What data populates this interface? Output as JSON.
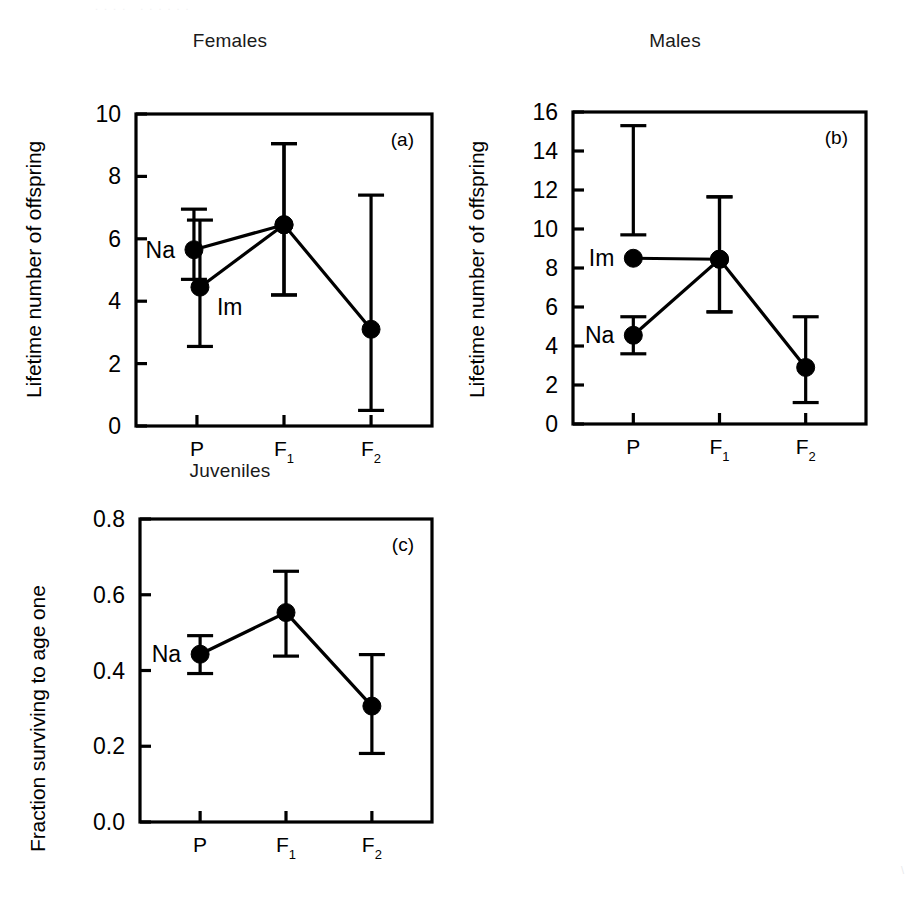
{
  "figure": {
    "background": "#ffffff",
    "ink_color": "#000000",
    "width": 922,
    "height": 898,
    "top_edge_artifact": "....  ......",
    "corner_artifact": "\\"
  },
  "chart_data": [
    {
      "id": "panel-a",
      "type": "line",
      "title": "Females",
      "panel_label": "(a)",
      "xlabel": "",
      "ylabel": "Lifetime number of offspring",
      "x": [
        "P",
        "F1",
        "F2"
      ],
      "x_tick_labels": [
        {
          "base": "P",
          "sub": ""
        },
        {
          "base": "F",
          "sub": "1"
        },
        {
          "base": "F",
          "sub": "2"
        }
      ],
      "ylim": [
        0,
        10
      ],
      "yticks": [
        0,
        2,
        4,
        6,
        8,
        10
      ],
      "ytick_labels": [
        "0",
        "2",
        "4",
        "6",
        "8",
        "10"
      ],
      "grid": false,
      "legend": "inline-labels",
      "error_type": "error bars",
      "series": [
        {
          "name": "Na",
          "label": "Na",
          "label_x": "P",
          "label_anchor": "left",
          "x": [
            "P",
            "F1",
            "F2"
          ],
          "values": [
            5.65,
            6.45,
            3.1
          ],
          "err_low": [
            4.7,
            4.2,
            0.5
          ],
          "err_high": [
            6.95,
            9.05,
            7.4
          ],
          "point_offset_px": [
            -3,
            0,
            0
          ]
        },
        {
          "name": "Im",
          "label": "Im",
          "label_x": "P",
          "label_anchor": "below-right",
          "x": [
            "P",
            "F1",
            "F2"
          ],
          "values": [
            4.45,
            6.45
          ],
          "err_low": [
            2.55,
            4.2
          ],
          "err_high": [
            6.6,
            9.05
          ],
          "point_offset_px": [
            3,
            0
          ]
        }
      ]
    },
    {
      "id": "panel-b",
      "type": "line",
      "title": "Males",
      "panel_label": "(b)",
      "xlabel": "",
      "ylabel": "Lifetime number of offspring",
      "x": [
        "P",
        "F1",
        "F2"
      ],
      "x_tick_labels": [
        {
          "base": "P",
          "sub": ""
        },
        {
          "base": "F",
          "sub": "1"
        },
        {
          "base": "F",
          "sub": "2"
        }
      ],
      "ylim": [
        0,
        16
      ],
      "yticks": [
        0,
        2,
        4,
        6,
        8,
        10,
        12,
        14,
        16
      ],
      "ytick_labels": [
        "0",
        "2",
        "4",
        "6",
        "8",
        "10",
        "12",
        "14",
        "16"
      ],
      "grid": false,
      "legend": "inline-labels",
      "error_type": "error bars",
      "series": [
        {
          "name": "Im",
          "label": "Im",
          "label_x": "P",
          "label_anchor": "left",
          "x": [
            "P",
            "F1",
            "F2"
          ],
          "values": [
            8.5,
            8.45
          ],
          "err_low": [
            9.7,
            5.75
          ],
          "err_high": [
            15.3,
            11.65
          ],
          "point_offset_px": [
            0,
            0
          ]
        },
        {
          "name": "Na",
          "label": "Na",
          "label_x": "P",
          "label_anchor": "left",
          "x": [
            "P",
            "F1",
            "F2"
          ],
          "values": [
            4.55,
            8.45,
            2.9
          ],
          "err_low": [
            3.6,
            5.75,
            1.1
          ],
          "err_high": [
            5.5,
            11.65,
            5.5
          ],
          "point_offset_px": [
            0,
            0,
            0
          ]
        }
      ]
    },
    {
      "id": "panel-c",
      "type": "line",
      "title": "Juveniles",
      "panel_label": "(c)",
      "xlabel": "",
      "ylabel": "Fraction surviving to age one",
      "x": [
        "P",
        "F1",
        "F2"
      ],
      "x_tick_labels": [
        {
          "base": "P",
          "sub": ""
        },
        {
          "base": "F",
          "sub": "1"
        },
        {
          "base": "F",
          "sub": "2"
        }
      ],
      "ylim": [
        0.0,
        0.8
      ],
      "yticks": [
        0.0,
        0.2,
        0.4,
        0.6,
        0.8
      ],
      "ytick_labels": [
        "0.0",
        "0.2",
        "0.4",
        "0.6",
        "0.8"
      ],
      "grid": false,
      "legend": "inline-labels",
      "error_type": "error bars",
      "series": [
        {
          "name": "Na",
          "label": "Na",
          "label_x": "P",
          "label_anchor": "left",
          "x": [
            "P",
            "F1",
            "F2"
          ],
          "values": [
            0.443,
            0.553,
            0.306
          ],
          "err_low": [
            0.392,
            0.438,
            0.181
          ],
          "err_high": [
            0.492,
            0.662,
            0.442
          ],
          "point_offset_px": [
            0,
            0,
            0
          ]
        }
      ]
    }
  ]
}
